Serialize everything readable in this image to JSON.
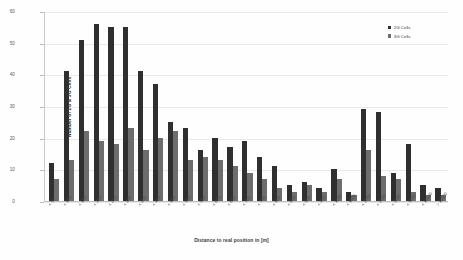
{
  "chart_data": {
    "type": "bar",
    "title": "",
    "xlabel": "Distance to real position in [m]",
    "ylabel": "Number of 2G & 3G Cells",
    "ylim": [
      0,
      60
    ],
    "yticks": [
      0,
      10,
      20,
      30,
      40,
      50,
      60
    ],
    "grid": true,
    "legend_position": "top-right",
    "categories": [
      "< 50",
      "< 100",
      "< 150",
      "< 200",
      "< 250",
      "< 300",
      "< 350",
      "< 400",
      "< 450",
      "< 500",
      "< 550",
      "< 600",
      "< 650",
      "< 700",
      "< 750",
      "< 800",
      "< 850",
      "< 900",
      "< 950",
      "< 1000",
      "< 1500",
      "< 2000",
      "< 2500",
      "< 3000",
      "< 5000",
      "< 10000",
      "> 10000"
    ],
    "series": [
      {
        "name": "2G Cells",
        "color": "#2f2f2f",
        "values": [
          12,
          41,
          51,
          56,
          55,
          55,
          41,
          37,
          25,
          23,
          16,
          20,
          17,
          19,
          14,
          11,
          5,
          6,
          4,
          10,
          3,
          29,
          28,
          9,
          18,
          5,
          4
        ]
      },
      {
        "name": "3G Cells",
        "color": "#6d6d6d",
        "values": [
          7,
          13,
          22,
          19,
          18,
          23,
          16,
          20,
          22,
          13,
          14,
          13,
          11,
          9,
          7,
          4,
          3,
          5,
          3,
          7,
          2,
          16,
          8,
          7,
          3,
          2,
          2
        ]
      }
    ]
  },
  "legend": {
    "items": [
      {
        "label": "2G Cells"
      },
      {
        "label": "3G Cells"
      }
    ]
  }
}
